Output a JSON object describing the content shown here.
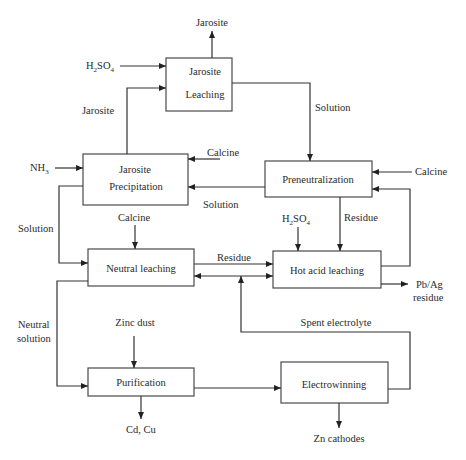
{
  "diagram": {
    "type": "process-flowchart",
    "boxes": {
      "jarosite_leaching": {
        "line1": "Jarosite",
        "line2": "Leaching"
      },
      "jarosite_precipitation": {
        "line1": "Jarosite",
        "line2": "Precipitation"
      },
      "preneutralization": {
        "label": "Preneutralization"
      },
      "neutral_leaching": {
        "label": "Neutral leaching"
      },
      "hot_acid_leaching": {
        "label": "Hot acid leaching"
      },
      "purification": {
        "label": "Purification"
      },
      "electrowinning": {
        "label": "Electrowinning"
      }
    },
    "labels": {
      "jarosite_out": "Jarosite",
      "h2so4_top_main": "H",
      "h2so4_top_sub2": "2",
      "h2so4_top_so": "SO",
      "h2so4_top_sub4": "4",
      "jarosite_recycle": "Jarosite",
      "solution_right": "Solution",
      "nh3_main": "NH",
      "nh3_sub": "3",
      "calcine_precip": "Calcine",
      "calcine_preneut": "Calcine",
      "solution_mid": "Solution",
      "solution_left": "Solution",
      "calcine_neutral": "Calcine",
      "h2so4_mid_main": "H",
      "h2so4_mid_sub2": "2",
      "h2so4_mid_so": "SO",
      "h2so4_mid_sub4": "4",
      "residue_preneut": "Residue",
      "residue_mid": "Residue",
      "pbag_line1": "Pb/Ag",
      "pbag_line2": "residue",
      "spent_electrolyte": "Spent electrolyte",
      "neutral_solution_line1": "Neutral",
      "neutral_solution_line2": "solution",
      "zinc_dust": "Zinc dust",
      "cd_cu": "Cd, Cu",
      "zn_cathodes": "Zn cathodes"
    }
  }
}
